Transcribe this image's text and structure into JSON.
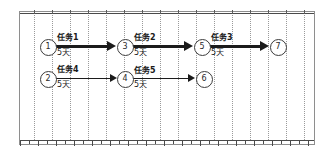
{
  "diagram": {
    "type": "activity-on-arrow-network",
    "nodes": [
      {
        "id": "n1",
        "label": "1",
        "x": 47,
        "y": 46
      },
      {
        "id": "n3",
        "label": "3",
        "x": 124,
        "y": 46
      },
      {
        "id": "n5",
        "label": "5",
        "x": 201,
        "y": 46
      },
      {
        "id": "n7",
        "label": "7",
        "x": 277,
        "y": 46
      },
      {
        "id": "n2",
        "label": "2",
        "x": 47,
        "y": 78
      },
      {
        "id": "n4",
        "label": "4",
        "x": 124,
        "y": 78
      },
      {
        "id": "n6",
        "label": "6",
        "x": 203,
        "y": 78
      }
    ],
    "edges": [
      {
        "id": "e1",
        "name": "任务1",
        "duration": "5天",
        "from": "n1",
        "to": "n3",
        "weight": "thick",
        "x1": 56,
        "x2": 116,
        "y": 46,
        "label_x": 57,
        "label_y": 33
      },
      {
        "id": "e2",
        "name": "任务2",
        "duration": "5天",
        "from": "n3",
        "to": "n5",
        "weight": "thick",
        "x1": 133,
        "x2": 193,
        "y": 46,
        "label_x": 134,
        "label_y": 33
      },
      {
        "id": "e3",
        "name": "任务3",
        "duration": "5天",
        "from": "n5",
        "to": "n7",
        "weight": "thick",
        "x1": 210,
        "x2": 269,
        "y": 46,
        "label_x": 211,
        "label_y": 33
      },
      {
        "id": "e4",
        "name": "任务4",
        "duration": "5天",
        "from": "n2",
        "to": "n4",
        "weight": "thin",
        "x1": 56,
        "x2": 117,
        "y": 78,
        "label_x": 57,
        "label_y": 65
      },
      {
        "id": "e5",
        "name": "任务5",
        "duration": "5天",
        "from": "n4",
        "to": "n6",
        "weight": "thin",
        "x1": 133,
        "x2": 195,
        "y": 78,
        "label_x": 134,
        "label_y": 66
      }
    ],
    "grid": {
      "line_color": "#9a9a9a",
      "style": "dotted-vertical",
      "x_positions": [
        34,
        52,
        70,
        88,
        106,
        124,
        142,
        160,
        178,
        196,
        214,
        232,
        250,
        268,
        286,
        304
      ]
    },
    "frame": {
      "border_color": "#8e8e8e",
      "rule_color": "#4a4a4a"
    },
    "ruler": {
      "baseline_y": 140,
      "tick_spacing": 9,
      "tick_count": 33,
      "major_every": 2
    },
    "colors": {
      "arrow": "#1b1b1b",
      "node_border": "#3c3c3c",
      "text": "#1a1a1a",
      "background": "#ffffff"
    }
  }
}
